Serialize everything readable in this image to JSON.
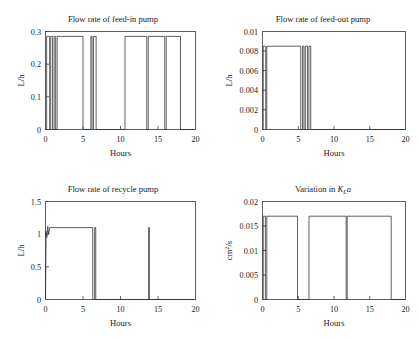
{
  "figure": {
    "background_color": "#ffffff",
    "line_color": "#2b2b2b",
    "axis_color": "#3a3a3a",
    "panel_count": 4
  },
  "chart_data": [
    {
      "type": "line",
      "panel": "top-left",
      "title": "Flow rate of feed-in pump",
      "xlabel": "Hours",
      "ylabel": "L/h",
      "xlim": [
        0,
        20
      ],
      "ylim": [
        0,
        0.3
      ],
      "xticks": [
        0,
        5,
        10,
        15,
        20
      ],
      "xtick_labels": [
        "0",
        "5",
        "10",
        "15",
        "20"
      ],
      "yticks": [
        0,
        0.1,
        0.2,
        0.3
      ],
      "ytick_labels": [
        "0",
        "0.1",
        "0.2",
        "0.3"
      ],
      "grid": false,
      "legend": "none",
      "high_level": 0.285,
      "low_level": 0,
      "description": "Square-wave on/off pump actuation signal",
      "segments": [
        [
          0.15,
          0.55
        ],
        [
          0.7,
          0.95
        ],
        [
          1.15,
          1.35
        ],
        [
          1.55,
          5.0
        ],
        [
          6.05,
          6.2
        ],
        [
          6.4,
          6.75
        ],
        [
          10.6,
          13.5
        ],
        [
          13.7,
          15.9
        ],
        [
          16.1,
          18.0
        ]
      ],
      "x": [
        0,
        0.15,
        0.15,
        0.55,
        0.55,
        0.7,
        0.7,
        0.95,
        0.95,
        1.15,
        1.15,
        1.35,
        1.35,
        1.55,
        1.55,
        5.0,
        5.0,
        6.05,
        6.05,
        6.2,
        6.2,
        6.4,
        6.4,
        6.75,
        6.75,
        10.6,
        10.6,
        13.5,
        13.5,
        13.7,
        13.7,
        15.9,
        15.9,
        16.1,
        16.1,
        18.0,
        18.0,
        20
      ],
      "y": [
        0,
        0,
        0.285,
        0.285,
        0,
        0,
        0.285,
        0.285,
        0,
        0,
        0.285,
        0.285,
        0,
        0,
        0.285,
        0.285,
        0,
        0,
        0.285,
        0.285,
        0,
        0,
        0.285,
        0.285,
        0,
        0,
        0.285,
        0.285,
        0,
        0,
        0.285,
        0.285,
        0,
        0,
        0.285,
        0.285,
        0,
        0
      ]
    },
    {
      "type": "line",
      "panel": "top-right",
      "title": "Flow rate of feed-out pump",
      "xlabel": "Hours",
      "ylabel": "L/h",
      "xlim": [
        0,
        20
      ],
      "ylim": [
        0,
        0.01
      ],
      "xticks": [
        0,
        5,
        10,
        15,
        20
      ],
      "xtick_labels": [
        "0",
        "5",
        "10",
        "15",
        "20"
      ],
      "yticks": [
        0,
        0.002,
        0.004,
        0.006,
        0.008,
        0.01
      ],
      "ytick_labels": [
        "0",
        "0.002",
        "0.004",
        "0.006",
        "0.008",
        "0.01"
      ],
      "grid": false,
      "legend": "none",
      "high_level": 0.0085,
      "low_level": 0,
      "description": "Square-wave on/off pump actuation signal concentrated in first 7 hours",
      "segments": [
        [
          0.1,
          0.45
        ],
        [
          0.6,
          5.35
        ],
        [
          5.6,
          5.8
        ],
        [
          6.0,
          6.3
        ],
        [
          6.5,
          6.75
        ]
      ],
      "x": [
        0,
        0.1,
        0.1,
        0.45,
        0.45,
        0.6,
        0.6,
        5.35,
        5.35,
        5.6,
        5.6,
        5.8,
        5.8,
        6.0,
        6.0,
        6.3,
        6.3,
        6.5,
        6.5,
        6.75,
        6.75,
        20
      ],
      "y": [
        0,
        0,
        0.0085,
        0.0085,
        0,
        0,
        0.0085,
        0.0085,
        0,
        0,
        0.0085,
        0.0085,
        0,
        0,
        0.0085,
        0.0085,
        0,
        0,
        0.0085,
        0.0085,
        0,
        0
      ]
    },
    {
      "type": "line",
      "panel": "bottom-left",
      "title": "Flow rate of recycle pump",
      "xlabel": "Hours",
      "ylabel": "L/h",
      "xlim": [
        0,
        20
      ],
      "ylim": [
        0,
        1.5
      ],
      "xticks": [
        0,
        5,
        10,
        15,
        20
      ],
      "xtick_labels": [
        "0",
        "5",
        "10",
        "15",
        "20"
      ],
      "yticks": [
        0,
        0.5,
        1,
        1.5
      ],
      "ytick_labels": [
        "0",
        "0.5",
        "1",
        "1.5"
      ],
      "grid": false,
      "legend": "none",
      "high_level": 1.1,
      "low_level": 0,
      "description": "Sustained plateau near 1.1 L/h from start to hour 6.3, short pulse at 6.6 and a narrow spike at 13.8",
      "segments": [
        [
          0.1,
          6.3
        ],
        [
          6.55,
          6.7
        ],
        [
          13.75,
          13.85
        ]
      ],
      "x": [
        0,
        0.08,
        0.18,
        0.3,
        0.42,
        0.55,
        0.7,
        6.3,
        6.3,
        6.55,
        6.55,
        6.7,
        6.7,
        13.75,
        13.75,
        13.85,
        13.85,
        20
      ],
      "y": [
        0,
        1.05,
        0.95,
        1.12,
        1.0,
        1.1,
        1.1,
        1.1,
        0,
        0,
        1.1,
        1.1,
        0,
        0,
        1.1,
        1.1,
        0,
        0
      ]
    },
    {
      "type": "line",
      "panel": "bottom-right",
      "title": "Variation in K_L a",
      "title_parts": {
        "prefix": "Variation in ",
        "symbol": "K",
        "subscript": "L",
        "suffix": "a"
      },
      "xlabel": "Hours",
      "ylabel": "cm2/s",
      "ylabel_parts": {
        "base": "cm",
        "exponent": "2",
        "denominator": "/s"
      },
      "xlim": [
        0,
        20
      ],
      "ylim": [
        0,
        0.02
      ],
      "xticks": [
        0,
        5,
        10,
        15,
        20
      ],
      "xtick_labels": [
        "0",
        "5",
        "10",
        "15",
        "20"
      ],
      "yticks": [
        0,
        0.005,
        0.01,
        0.015,
        0.02
      ],
      "ytick_labels": [
        "0",
        "0.005",
        "0.01",
        "0.015",
        "0.02"
      ],
      "grid": false,
      "legend": "none",
      "high_level": 0.017,
      "low_level": 0,
      "description": "Mass transfer coefficient steps between 0 and 0.017 cm2/s",
      "segments": [
        [
          0.1,
          0.4
        ],
        [
          0.6,
          4.9
        ],
        [
          6.5,
          11.7
        ],
        [
          11.85,
          18.0
        ]
      ],
      "x": [
        0,
        0.1,
        0.1,
        0.4,
        0.4,
        0.6,
        0.6,
        4.9,
        4.9,
        6.5,
        6.5,
        11.7,
        11.7,
        11.85,
        11.85,
        18.0,
        18.0,
        20
      ],
      "y": [
        0,
        0,
        0.017,
        0.017,
        0,
        0,
        0.017,
        0.017,
        0,
        0,
        0.017,
        0.017,
        0,
        0,
        0.017,
        0.017,
        0,
        0
      ]
    }
  ]
}
